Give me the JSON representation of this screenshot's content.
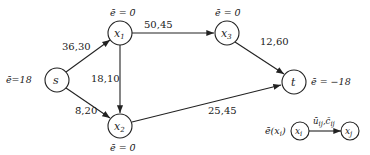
{
  "nodes": {
    "s": {
      "label": "s",
      "excess": "ē=18"
    },
    "x1": {
      "label": "x",
      "sub": "1",
      "excess": "ē = 0̄"
    },
    "x2": {
      "label": "x",
      "sub": "2",
      "excess": "ē = 0̄"
    },
    "x3": {
      "label": "x",
      "sub": "3",
      "excess": "ē = 0̄"
    },
    "t": {
      "label": "t",
      "excess": "ē = −18"
    }
  },
  "edges": {
    "s_x1": {
      "label": "36,30"
    },
    "s_x2": {
      "label": "8̄,20"
    },
    "x1_x2": {
      "label": "18,10"
    },
    "x1_x3": {
      "label": "50,45"
    },
    "x3_t": {
      "label": "12,60"
    },
    "x2_t": {
      "label": "25,45"
    }
  },
  "legend": {
    "excess_label": "ē(x",
    "excess_sub": "i",
    "excess_close": ")",
    "from_node": "x",
    "from_sub": "i",
    "to_node": "x",
    "to_sub": "j",
    "edge_label": "ū",
    "edge_label_sub": "ij",
    "edge_label_sep": ",",
    "edge_label2": "c̄",
    "edge_label2_sub": "ij"
  }
}
